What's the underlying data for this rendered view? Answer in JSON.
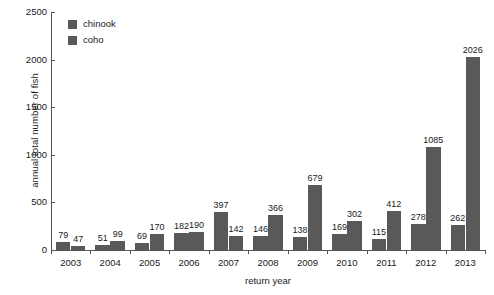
{
  "chart_data": {
    "type": "bar",
    "title": "",
    "xlabel": "return year",
    "ylabel": "annual total number of fish",
    "categories": [
      "2003",
      "2004",
      "2005",
      "2006",
      "2007",
      "2008",
      "2009",
      "2010",
      "2011",
      "2012",
      "2013"
    ],
    "series": [
      {
        "name": "chinook",
        "color": "#595959",
        "values": [
          79,
          51,
          69,
          182,
          397,
          146,
          138,
          169,
          115,
          278,
          262
        ]
      },
      {
        "name": "coho",
        "color": "#595959",
        "values": [
          47,
          99,
          170,
          190,
          142,
          366,
          679,
          302,
          412,
          1085,
          2026
        ]
      }
    ],
    "ylim": [
      0,
      2500
    ],
    "yticks": [
      0,
      500,
      1000,
      1500,
      2000,
      2500
    ],
    "ytick_labels": [
      "0",
      "500",
      "1000",
      "1500",
      "2000",
      "2500"
    ],
    "grid": false,
    "legend_position": "top-left",
    "show_data_labels": true
  },
  "axis": {
    "y_title": "annual total number of fish",
    "x_title": "return year"
  },
  "legend": {
    "entries": [
      {
        "label": "chinook",
        "color": "#595959"
      },
      {
        "label": "coho",
        "color": "#595959"
      }
    ]
  },
  "colors": {
    "axis": "#555555",
    "text": "#1a1a1a",
    "background": "#ffffff",
    "bar_chinook": "#595959",
    "bar_coho": "#595959"
  }
}
